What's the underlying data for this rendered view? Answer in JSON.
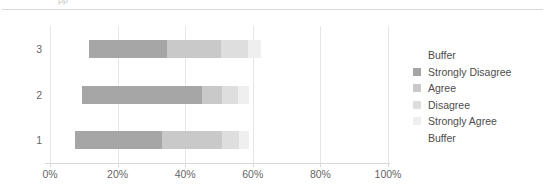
{
  "header": {
    "clipped_text": "pp"
  },
  "chart_data": {
    "type": "bar",
    "orientation": "horizontal",
    "stacked": true,
    "title": "",
    "subtitle": "",
    "xlabel": "",
    "ylabel": "",
    "categories": [
      "3",
      "2",
      "1"
    ],
    "category_order_bottom_to_top": [
      "1",
      "2",
      "3"
    ],
    "xlim": [
      0,
      100
    ],
    "xticks": [
      0,
      20,
      40,
      60,
      80,
      100
    ],
    "xtick_labels": [
      "0%",
      "20%",
      "40%",
      "60%",
      "80%",
      "100%"
    ],
    "grid": true,
    "grid_axis": "x",
    "legend_position": "right",
    "series": [
      {
        "name": "Buffer",
        "color": "#ffffff",
        "values": [
          11.5,
          9.5,
          7.5
        ]
      },
      {
        "name": "Strongly Disagree",
        "color": "#a6a6a6",
        "values": [
          23.0,
          35.5,
          25.5
        ]
      },
      {
        "name": "Agree",
        "color": "#c9c9c9",
        "values": [
          16.0,
          6.0,
          18.0
        ]
      },
      {
        "name": "Disagree",
        "color": "#dedede",
        "values": [
          8.0,
          4.5,
          5.0
        ]
      },
      {
        "name": "Strongly Agree",
        "color": "#efefef",
        "values": [
          4.0,
          3.5,
          3.0
        ]
      },
      {
        "name": "Buffer",
        "color": "#ffffff",
        "values": [
          0,
          0,
          0
        ]
      }
    ],
    "legend_entries": [
      {
        "label": "Buffer",
        "color": "#ffffff",
        "swatch_visible": false
      },
      {
        "label": "Strongly Disagree",
        "color": "#a6a6a6",
        "swatch_visible": true
      },
      {
        "label": "Agree",
        "color": "#c9c9c9",
        "swatch_visible": true
      },
      {
        "label": "Disagree",
        "color": "#dedede",
        "swatch_visible": true
      },
      {
        "label": "Strongly Agree",
        "color": "#efefef",
        "swatch_visible": true
      },
      {
        "label": "Buffer",
        "color": "#ffffff",
        "swatch_visible": false
      }
    ],
    "colors": {
      "gridline": "#e6e6e6",
      "axis": "#d9d9d9",
      "text": "#666666",
      "legend_text": "#4d4d4d"
    }
  }
}
